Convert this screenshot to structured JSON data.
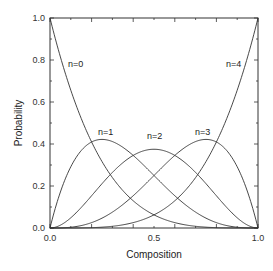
{
  "chart_data": {
    "type": "line",
    "title": "",
    "xlabel": "Composition",
    "ylabel": "Probability",
    "xlim": [
      0.0,
      1.0
    ],
    "ylim": [
      0.0,
      1.0
    ],
    "x_ticks": [
      "0.0",
      "0.5",
      "1.0"
    ],
    "y_ticks": [
      "0.0",
      "0.2",
      "0.4",
      "0.6",
      "0.8",
      "1.0"
    ],
    "grid": false,
    "legend": "inline labels",
    "x": [
      0.0,
      0.1,
      0.2,
      0.25,
      0.3,
      0.4,
      0.5,
      0.6,
      0.7,
      0.75,
      0.8,
      0.9,
      1.0
    ],
    "series": [
      {
        "name": "n=0",
        "values": [
          1.0,
          0.656,
          0.41,
          0.316,
          0.24,
          0.13,
          0.0625,
          0.026,
          0.008,
          0.004,
          0.002,
          0.0001,
          0.0
        ]
      },
      {
        "name": "n=1",
        "values": [
          0.0,
          0.292,
          0.41,
          0.422,
          0.412,
          0.346,
          0.25,
          0.154,
          0.076,
          0.047,
          0.026,
          0.004,
          0.0
        ]
      },
      {
        "name": "n=2",
        "values": [
          0.0,
          0.049,
          0.154,
          0.211,
          0.265,
          0.346,
          0.375,
          0.346,
          0.265,
          0.211,
          0.154,
          0.049,
          0.0
        ]
      },
      {
        "name": "n=3",
        "values": [
          0.0,
          0.004,
          0.026,
          0.047,
          0.076,
          0.154,
          0.25,
          0.346,
          0.412,
          0.422,
          0.41,
          0.292,
          0.0
        ]
      },
      {
        "name": "n=4",
        "values": [
          0.0,
          0.0001,
          0.002,
          0.004,
          0.008,
          0.026,
          0.0625,
          0.13,
          0.24,
          0.316,
          0.41,
          0.656,
          1.0
        ]
      }
    ],
    "annotations": [
      {
        "text": "n=0",
        "x": 0.09,
        "y": 0.79
      },
      {
        "text": "n=1",
        "x": 0.23,
        "y": 0.45
      },
      {
        "text": "n=2",
        "x": 0.47,
        "y": 0.44
      },
      {
        "text": "n=3",
        "x": 0.73,
        "y": 0.45
      },
      {
        "text": "n=4",
        "x": 0.84,
        "y": 0.79
      }
    ]
  },
  "labels": {
    "xlabel": "Composition",
    "ylabel": "Probability",
    "x0": "0.0",
    "x1": "0.5",
    "x2": "1.0",
    "y0": "0.0",
    "y1": "0.2",
    "y2": "0.4",
    "y3": "0.6",
    "y4": "0.8",
    "y5": "1.0",
    "n0": "n=0",
    "n1": "n=1",
    "n2": "n=2",
    "n3": "n=3",
    "n4": "n=4"
  }
}
